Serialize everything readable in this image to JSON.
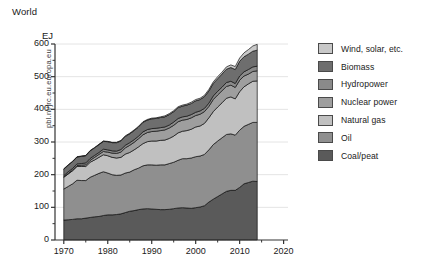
{
  "chart_title": "World",
  "watermark": "pbl.nl/jrc.eu.europa.eu",
  "axis": {
    "y_unit": "EJ",
    "y_ticks": [
      0,
      100,
      200,
      300,
      400,
      500,
      600
    ],
    "x_ticks": [
      1970,
      1980,
      1990,
      2000,
      2010,
      2020
    ],
    "x_minor_step": 5,
    "ylim": [
      0,
      600
    ],
    "xlim": [
      1968,
      2021
    ]
  },
  "colors": {
    "wind_solar": "#c8c8c8",
    "biomass": "#6e6e6e",
    "hydropower": "#8a8a8a",
    "nuclear_power": "#9e9e9e",
    "natural_gas": "#c0c0c0",
    "oil": "#8f8f8f",
    "coal_peat": "#5a5a5a",
    "gridline": "#e4e4e4",
    "outline": "#111111",
    "axis": "#333333"
  },
  "legend": {
    "items": [
      {
        "label": "Wind, solar, etc.",
        "key": "wind_solar"
      },
      {
        "label": "Biomass",
        "key": "biomass"
      },
      {
        "label": "Hydropower",
        "key": "hydropower"
      },
      {
        "label": "Nuclear power",
        "key": "nuclear_power"
      },
      {
        "label": "Natural gas",
        "key": "natural_gas"
      },
      {
        "label": "Oil",
        "key": "oil"
      },
      {
        "label": "Coal/peat",
        "key": "coal_peat"
      }
    ]
  },
  "chart_data": {
    "type": "area",
    "title": "World",
    "xlabel": "",
    "ylabel": "EJ",
    "ylim": [
      0,
      600
    ],
    "xlim": [
      1968,
      2021
    ],
    "grid": true,
    "legend_position": "right",
    "stacked": true,
    "stack_order_bottom_to_top": [
      "Coal/peat",
      "Oil",
      "Natural gas",
      "Nuclear power",
      "Hydropower",
      "Biomass",
      "Wind, solar, etc."
    ],
    "x": [
      1970,
      1971,
      1972,
      1973,
      1974,
      1975,
      1976,
      1977,
      1978,
      1979,
      1980,
      1981,
      1982,
      1983,
      1984,
      1985,
      1986,
      1987,
      1988,
      1989,
      1990,
      1991,
      1992,
      1993,
      1994,
      1995,
      1996,
      1997,
      1998,
      1999,
      2000,
      2001,
      2002,
      2003,
      2004,
      2005,
      2006,
      2007,
      2008,
      2009,
      2010,
      2011,
      2012,
      2013,
      2014
    ],
    "series": [
      {
        "name": "Coal/peat",
        "values": [
          61,
          62,
          63,
          65,
          65,
          67,
          69,
          71,
          72,
          75,
          77,
          77,
          78,
          80,
          84,
          88,
          90,
          93,
          95,
          96,
          95,
          94,
          93,
          93,
          94,
          96,
          98,
          99,
          98,
          97,
          99,
          101,
          105,
          116,
          125,
          133,
          141,
          149,
          152,
          152,
          161,
          172,
          176,
          180,
          179
        ]
      },
      {
        "name": "Oil",
        "values": [
          95,
          102,
          109,
          118,
          117,
          115,
          123,
          127,
          132,
          134,
          128,
          123,
          120,
          119,
          121,
          120,
          125,
          127,
          132,
          134,
          135,
          135,
          137,
          137,
          140,
          142,
          146,
          150,
          151,
          154,
          156,
          156,
          157,
          160,
          167,
          170,
          172,
          174,
          173,
          169,
          175,
          176,
          178,
          180,
          181
        ]
      },
      {
        "name": "Natural gas",
        "values": [
          36,
          38,
          40,
          42,
          43,
          43,
          46,
          47,
          49,
          52,
          53,
          53,
          53,
          54,
          58,
          60,
          61,
          65,
          68,
          71,
          73,
          74,
          75,
          76,
          77,
          80,
          84,
          84,
          86,
          88,
          91,
          92,
          95,
          98,
          101,
          104,
          107,
          111,
          113,
          111,
          118,
          121,
          124,
          126,
          127
        ]
      },
      {
        "name": "Nuclear power",
        "values": [
          1,
          2,
          2,
          3,
          4,
          5,
          6,
          8,
          9,
          10,
          11,
          13,
          14,
          16,
          19,
          22,
          23,
          25,
          27,
          28,
          29,
          30,
          30,
          31,
          32,
          33,
          34,
          34,
          34,
          35,
          35,
          36,
          36,
          35,
          37,
          37,
          37,
          36,
          36,
          35,
          35,
          33,
          30,
          30,
          31
        ]
      },
      {
        "name": "Hydropower",
        "values": [
          4,
          5,
          5,
          5,
          5,
          6,
          6,
          6,
          6,
          7,
          7,
          7,
          7,
          8,
          8,
          8,
          8,
          8,
          9,
          9,
          9,
          9,
          9,
          9,
          9,
          10,
          10,
          10,
          10,
          10,
          10,
          10,
          10,
          10,
          11,
          11,
          11,
          12,
          12,
          12,
          13,
          13,
          14,
          14,
          14
        ]
      },
      {
        "name": "Biomass",
        "values": [
          20,
          20,
          21,
          21,
          22,
          22,
          23,
          23,
          24,
          24,
          25,
          25,
          26,
          26,
          27,
          27,
          28,
          28,
          29,
          29,
          30,
          30,
          31,
          31,
          32,
          32,
          33,
          33,
          34,
          34,
          35,
          35,
          36,
          37,
          38,
          39,
          40,
          41,
          42,
          43,
          45,
          46,
          47,
          48,
          49
        ]
      },
      {
        "name": "Wind, solar, etc.",
        "values": [
          1,
          1,
          1,
          1,
          1,
          1,
          1,
          1,
          1,
          1,
          1,
          1,
          1,
          2,
          2,
          2,
          2,
          2,
          2,
          2,
          2,
          2,
          2,
          3,
          3,
          3,
          3,
          3,
          3,
          4,
          4,
          4,
          4,
          5,
          5,
          6,
          6,
          7,
          8,
          9,
          10,
          12,
          14,
          16,
          18
        ]
      }
    ]
  }
}
